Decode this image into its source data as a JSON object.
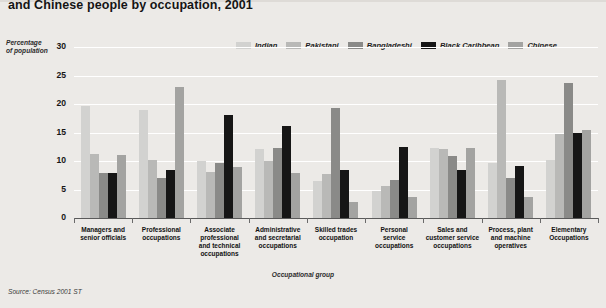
{
  "title": "and Chinese people by occupation, 2001",
  "source": "Source: Census 2001 ST",
  "axis": {
    "ylabel_line1": "Percentage",
    "ylabel_line2": "of population",
    "xlabel": "Occupational group"
  },
  "legend": [
    {
      "label": "Indian",
      "color": "#d2d2d0"
    },
    {
      "label": "Pakistani",
      "color": "#b9b9b7"
    },
    {
      "label": "Bangladeshi",
      "color": "#8a8a88"
    },
    {
      "label": "Black Caribbean",
      "color": "#161616"
    },
    {
      "label": "Chinese",
      "color": "#a3a3a1"
    }
  ],
  "chart_data": {
    "type": "bar",
    "title": "and Chinese people by occupation, 2001",
    "xlabel": "Occupational group",
    "ylabel": "Percentage of population",
    "ylim": [
      0,
      30
    ],
    "yticks": [
      0,
      5,
      10,
      15,
      20,
      25,
      30
    ],
    "grid": true,
    "legend_position": "top-right",
    "categories": [
      "Managers and senior officials",
      "Professional occupations",
      "Associate professional and technical occupations",
      "Administrative and secretarial occupations",
      "Skilled trades occupation",
      "Personal service occupations",
      "Sales and customer service occupations",
      "Process, plant and machine operatives",
      "Elementary Occupations"
    ],
    "series": [
      {
        "name": "Indian",
        "color": "#d2d2d0",
        "values": [
          19.6,
          19.0,
          10.0,
          12.1,
          6.5,
          4.7,
          12.3,
          9.6,
          10.2
        ]
      },
      {
        "name": "Pakistani",
        "color": "#b9b9b7",
        "values": [
          11.2,
          10.2,
          8.0,
          10.0,
          7.7,
          5.7,
          12.1,
          24.3,
          14.7
        ]
      },
      {
        "name": "Bangladeshi",
        "color": "#8a8a88",
        "values": [
          7.9,
          7.0,
          9.6,
          12.2,
          19.3,
          6.6,
          10.8,
          7.1,
          23.6
        ]
      },
      {
        "name": "Black Caribbean",
        "color": "#161616",
        "values": [
          7.9,
          8.5,
          18.0,
          16.1,
          8.5,
          12.4,
          8.4,
          9.2,
          15.0
        ]
      },
      {
        "name": "Chinese",
        "color": "#a3a3a1",
        "values": [
          11.0,
          22.9,
          9.0,
          7.9,
          2.8,
          3.6,
          12.2,
          3.7,
          15.4
        ]
      }
    ]
  },
  "category_labels": [
    [
      "Managers and",
      "senior officials"
    ],
    [
      "Professional",
      "occupations"
    ],
    [
      "Associate",
      "professional",
      "and technical",
      "occupations"
    ],
    [
      "Administrative",
      "and secretarial",
      "occupations"
    ],
    [
      "Skilled trades",
      "occupation"
    ],
    [
      "Personal",
      "service",
      "occupations"
    ],
    [
      "Sales and",
      "customer service",
      "occupations"
    ],
    [
      "Process, plant",
      "and machine",
      "operatives"
    ],
    [
      "Elementary",
      "Occupations"
    ]
  ]
}
